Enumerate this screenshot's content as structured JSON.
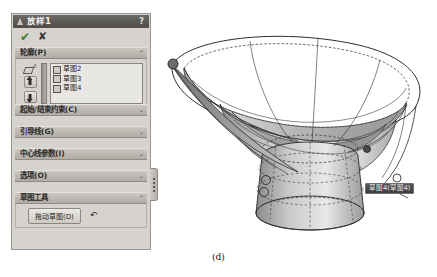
{
  "panel": {
    "title": "放样1",
    "title_icon": "loft-cone-icon",
    "help_label": "?",
    "confirm": {
      "ok_label": "✔",
      "ok_color": "#3f7a2e",
      "cancel_label": "✘",
      "cancel_color": "#39383a"
    },
    "profile_section": {
      "label": "轮廓(P)",
      "collapse_chevron": "⌃",
      "selection_icon": "profile-parallelogram-icon",
      "selection_icon_superscript": "0",
      "move_up_label": "▲",
      "move_down_label": "▼",
      "items": [
        {
          "label": "草图2"
        },
        {
          "label": "草图3"
        },
        {
          "label": "草图4"
        }
      ]
    },
    "sections": [
      {
        "label": "起始/结束约束(C)",
        "chevron": "⌄"
      },
      {
        "label": "引导线(G)",
        "chevron": "⌄"
      },
      {
        "label": "中心线参数(I)",
        "chevron": "⌄"
      },
      {
        "label": "选项(O)",
        "chevron": "⌄"
      }
    ],
    "sketch_tools": {
      "label": "草图工具",
      "chevron": "⌃",
      "drag_button_label": "拖动草图(D)",
      "undo_icon": "undo-arrow-icon"
    },
    "handle_icon": "panel-drag-handle-icon"
  },
  "viewport": {
    "callout": {
      "text": "草图4(草图4)"
    },
    "model": {
      "name": "lofted-funnel-surface",
      "face_light": "#e4e4e4",
      "face_mid": "#bfbfbf",
      "face_dark": "#9a9a9a",
      "edge_color": "#2b2b2b"
    }
  },
  "caption": {
    "text": "(d)"
  }
}
